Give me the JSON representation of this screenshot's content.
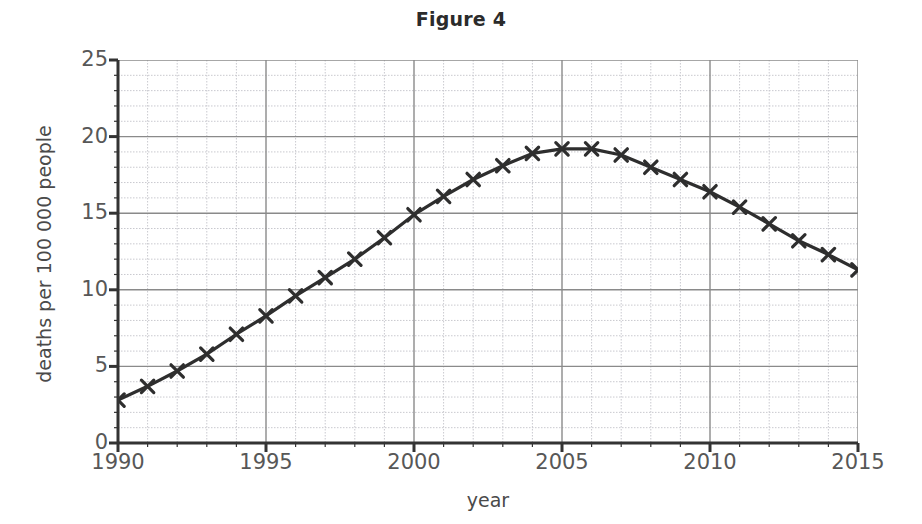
{
  "chart_data": {
    "type": "line",
    "title": "Figure 4",
    "xlabel": "year",
    "ylabel": "deaths per 100 000 people",
    "xlim": [
      1990,
      2015
    ],
    "ylim": [
      0,
      25
    ],
    "x_major_ticks": [
      1990,
      1995,
      2000,
      2005,
      2010,
      2015
    ],
    "y_major_ticks": [
      0,
      5,
      10,
      15,
      20,
      25
    ],
    "x_minor_step": 1,
    "y_minor_step": 1,
    "grid": true,
    "legend": null,
    "marker": "x",
    "line_color": "#2e2e2e",
    "marker_color": "#2e2e2e",
    "major_grid_color": "#8a8a8a",
    "minor_grid_color": "#c9c9cf",
    "x": [
      1990,
      1991,
      1992,
      1993,
      1994,
      1995,
      1996,
      1997,
      1998,
      1999,
      2000,
      2001,
      2002,
      2003,
      2004,
      2005,
      2006,
      2007,
      2008,
      2009,
      2010,
      2011,
      2012,
      2013,
      2014,
      2015
    ],
    "values": [
      2.8,
      3.7,
      4.7,
      5.8,
      7.1,
      8.3,
      9.6,
      10.8,
      12.0,
      13.4,
      14.9,
      16.1,
      17.2,
      18.1,
      18.9,
      19.2,
      19.2,
      18.8,
      18.0,
      17.2,
      16.4,
      15.4,
      14.3,
      13.2,
      12.3,
      11.3
    ],
    "series": [
      {
        "name": "deaths per 100 000 people",
        "values": [
          2.8,
          3.7,
          4.7,
          5.8,
          7.1,
          8.3,
          9.6,
          10.8,
          12.0,
          13.4,
          14.9,
          16.1,
          17.2,
          18.1,
          18.9,
          19.2,
          19.2,
          18.8,
          18.0,
          17.2,
          16.4,
          15.4,
          14.3,
          13.2,
          12.3,
          11.3
        ]
      }
    ]
  },
  "axis": {
    "y_tick_labels": [
      "25",
      "20",
      "15",
      "10",
      "5",
      "0"
    ],
    "x_tick_labels": [
      "1990",
      "1995",
      "2000",
      "2005",
      "2010",
      "2015"
    ]
  }
}
